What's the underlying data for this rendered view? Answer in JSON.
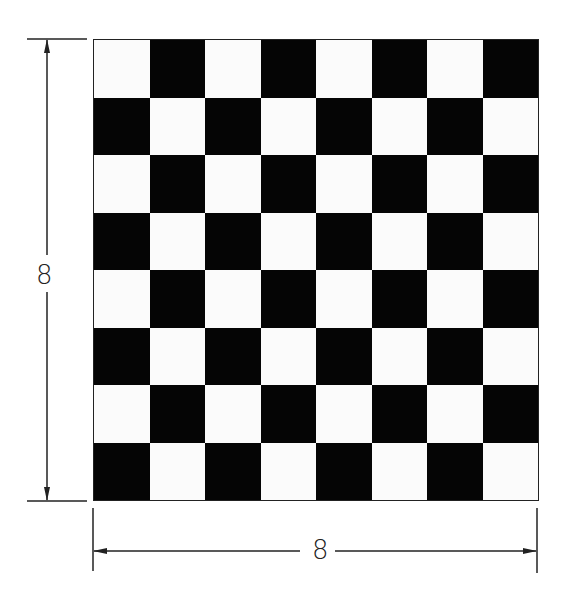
{
  "diagram": {
    "type": "checkerboard",
    "rows": 8,
    "columns": 8,
    "top_left_color": "white",
    "colors": {
      "dark": "#050505",
      "light": "#fbfbfb",
      "line": "#222222"
    },
    "dimensions": {
      "height_label": "8",
      "width_label": "8"
    }
  }
}
